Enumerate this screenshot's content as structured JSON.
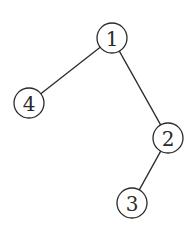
{
  "diagram": {
    "type": "tree",
    "nodes": [
      {
        "id": "1",
        "label": "1",
        "x": 112,
        "y": 38
      },
      {
        "id": "4",
        "label": "4",
        "x": 29,
        "y": 103
      },
      {
        "id": "2",
        "label": "2",
        "x": 168,
        "y": 138
      },
      {
        "id": "3",
        "label": "3",
        "x": 132,
        "y": 203
      }
    ],
    "edges": [
      {
        "from": "1",
        "to": "4"
      },
      {
        "from": "1",
        "to": "2"
      },
      {
        "from": "2",
        "to": "3"
      }
    ],
    "node_radius": 15,
    "stroke_color": "#2a2a2a"
  }
}
